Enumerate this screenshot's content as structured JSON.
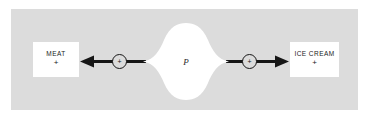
{
  "figure": {
    "title": "",
    "background_color": "#ffffff",
    "panel_color": "#dcdcdc",
    "ink_color": "#161616"
  },
  "diagram": {
    "type": "causal-influence-diagram",
    "nodes": {
      "left": {
        "label": "MEAT",
        "sign": "+",
        "name": "meat-node"
      },
      "center": {
        "label": "P",
        "name": "p-cloud-node",
        "shape": "cloud"
      },
      "right": {
        "label": "ICE CREAM",
        "sign": "+",
        "name": "ice-cream-node"
      }
    },
    "operators": {
      "left": {
        "symbol": "+"
      },
      "right": {
        "symbol": "+"
      }
    },
    "edges": [
      {
        "from": "P",
        "to": "MEAT",
        "sign": "+",
        "direction": "left"
      },
      {
        "from": "P",
        "to": "ICE CREAM",
        "sign": "+",
        "direction": "right"
      }
    ]
  }
}
